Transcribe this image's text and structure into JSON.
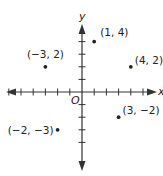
{
  "chart_data": {
    "type": "scatter",
    "title": "",
    "xlabel": "x",
    "ylabel": "y",
    "origin_label": "O",
    "xlim": [
      -6,
      6
    ],
    "ylim": [
      -6,
      5
    ],
    "grid": false,
    "x_ticks": [
      -6,
      -5,
      -4,
      -3,
      -2,
      -1,
      1,
      2,
      3,
      4,
      5
    ],
    "y_ticks": [
      -4,
      -3,
      -2,
      -1,
      1,
      2,
      3,
      4
    ],
    "points": [
      {
        "x": 1,
        "y": 4,
        "label": "(1, 4)"
      },
      {
        "x": -3,
        "y": 2,
        "label": "(−3, 2)"
      },
      {
        "x": 4,
        "y": 2,
        "label": "(4, 2)"
      },
      {
        "x": 3,
        "y": -2,
        "label": "(3, −2)"
      },
      {
        "x": -2,
        "y": -3,
        "label": "(−2, −3)"
      }
    ]
  },
  "colors": {
    "axis": "#333333",
    "point": "#222222",
    "text": "#222222"
  }
}
